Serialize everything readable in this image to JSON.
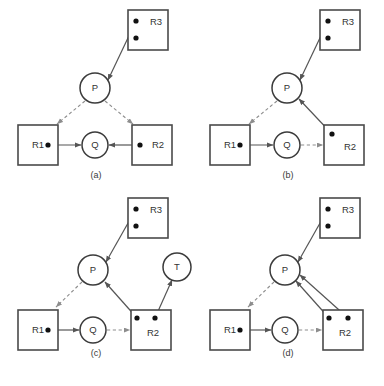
{
  "figure": {
    "width": 384,
    "height": 386,
    "background": "#ffffff",
    "colors": {
      "box_stroke": "#4a4a4a",
      "circle_stroke": "#3b3b3b",
      "dot_fill": "#111111",
      "solid_edge": "#555555",
      "dashed_edge": "#8d8d8d",
      "text": "#333333"
    },
    "legend_semantics": {
      "solid_arrow": "assignment edge (resource held by process)",
      "dashed_arrow": "request edge (process waiting for resource)",
      "square_node": "resource",
      "circle_node": "process",
      "dot": "resource instance"
    }
  },
  "panels": [
    {
      "id": "a",
      "caption": "(a)",
      "caption_x": 96,
      "caption_y": 178,
      "boxes": [
        {
          "name": "R1",
          "label": "R1",
          "x": 18,
          "y": 125,
          "w": 40,
          "h": 40,
          "label_x": 32,
          "label_y": 145,
          "dots": [
            {
              "x": 48,
              "y": 145
            }
          ]
        },
        {
          "name": "R2",
          "label": "R2",
          "x": 132,
          "y": 125,
          "w": 40,
          "h": 40,
          "label_x": 152,
          "label_y": 145,
          "dots": [
            {
              "x": 140,
              "y": 145
            }
          ]
        },
        {
          "name": "R3",
          "label": "R3",
          "x": 128,
          "y": 10,
          "w": 40,
          "h": 40,
          "label_x": 150,
          "label_y": 22,
          "dots": [
            {
              "x": 136,
              "y": 21
            },
            {
              "x": 136,
              "y": 38
            }
          ]
        }
      ],
      "circles": [
        {
          "name": "P",
          "label": "P",
          "cx": 95,
          "cy": 88,
          "r": 15
        },
        {
          "name": "Q",
          "label": "Q",
          "cx": 95,
          "cy": 145,
          "r": 13
        }
      ],
      "edges": [
        {
          "name": "R3-to-P",
          "type": "solid",
          "x1": 136,
          "y1": 21,
          "x2": 108,
          "y2": 80
        },
        {
          "name": "P-to-R1",
          "type": "dashed",
          "x1": 85,
          "y1": 101,
          "x2": 57,
          "y2": 124
        },
        {
          "name": "P-to-R2",
          "type": "dashed",
          "x1": 105,
          "y1": 101,
          "x2": 133,
          "y2": 124
        },
        {
          "name": "R1-to-Q",
          "type": "solid",
          "x1": 48,
          "y1": 145,
          "x2": 81,
          "y2": 145
        },
        {
          "name": "R2-to-Q",
          "type": "solid",
          "x1": 140,
          "y1": 145,
          "x2": 109,
          "y2": 145
        }
      ]
    },
    {
      "id": "b",
      "caption": "(b)",
      "caption_x": 288,
      "caption_y": 178,
      "boxes": [
        {
          "name": "R1",
          "label": "R1",
          "x": 210,
          "y": 125,
          "w": 40,
          "h": 40,
          "label_x": 224,
          "label_y": 145,
          "dots": [
            {
              "x": 240,
              "y": 145
            }
          ]
        },
        {
          "name": "R2",
          "label": "R2",
          "x": 324,
          "y": 125,
          "w": 40,
          "h": 40,
          "label_x": 344,
          "label_y": 147,
          "dots": [
            {
              "x": 332,
              "y": 134
            }
          ]
        },
        {
          "name": "R3",
          "label": "R3",
          "x": 320,
          "y": 10,
          "w": 40,
          "h": 40,
          "label_x": 342,
          "label_y": 22,
          "dots": [
            {
              "x": 328,
              "y": 21
            },
            {
              "x": 328,
              "y": 38
            }
          ]
        }
      ],
      "circles": [
        {
          "name": "P",
          "label": "P",
          "cx": 287,
          "cy": 88,
          "r": 15
        },
        {
          "name": "Q",
          "label": "Q",
          "cx": 287,
          "cy": 145,
          "r": 13
        }
      ],
      "edges": [
        {
          "name": "R3-to-P",
          "type": "solid",
          "x1": 328,
          "y1": 21,
          "x2": 300,
          "y2": 80
        },
        {
          "name": "P-to-R1",
          "type": "dashed",
          "x1": 277,
          "y1": 101,
          "x2": 249,
          "y2": 124
        },
        {
          "name": "R2-to-P",
          "type": "solid",
          "x1": 332,
          "y1": 134,
          "x2": 299,
          "y2": 99
        },
        {
          "name": "R1-to-Q",
          "type": "solid",
          "x1": 240,
          "y1": 145,
          "x2": 273,
          "y2": 145
        },
        {
          "name": "Q-to-R2",
          "type": "dashed",
          "x1": 301,
          "y1": 145,
          "x2": 323,
          "y2": 145
        }
      ]
    },
    {
      "id": "c",
      "caption": "(c)",
      "caption_x": 96,
      "caption_y": 356,
      "boxes": [
        {
          "name": "R1",
          "label": "R1",
          "x": 18,
          "y": 310,
          "w": 40,
          "h": 40,
          "label_x": 32,
          "label_y": 330,
          "dots": [
            {
              "x": 48,
              "y": 330
            }
          ]
        },
        {
          "name": "R2",
          "label": "R2",
          "x": 131,
          "y": 310,
          "w": 40,
          "h": 40,
          "label_x": 147,
          "label_y": 333,
          "dots": [
            {
              "x": 137,
              "y": 318
            },
            {
              "x": 155,
              "y": 318
            }
          ]
        },
        {
          "name": "R3",
          "label": "R3",
          "x": 128,
          "y": 198,
          "w": 40,
          "h": 40,
          "label_x": 150,
          "label_y": 210,
          "dots": [
            {
              "x": 136,
              "y": 209
            },
            {
              "x": 136,
              "y": 226
            }
          ]
        }
      ],
      "circles": [
        {
          "name": "P",
          "label": "P",
          "cx": 93,
          "cy": 270,
          "r": 15
        },
        {
          "name": "Q",
          "label": "Q",
          "cx": 93,
          "cy": 330,
          "r": 13
        },
        {
          "name": "T",
          "label": "T",
          "cx": 177,
          "cy": 267,
          "r": 14
        }
      ],
      "edges": [
        {
          "name": "R3-to-P",
          "type": "solid",
          "x1": 136,
          "y1": 209,
          "x2": 106,
          "y2": 262
        },
        {
          "name": "P-to-R1",
          "type": "dashed",
          "x1": 82,
          "y1": 282,
          "x2": 56,
          "y2": 307
        },
        {
          "name": "R2-to-P",
          "type": "solid",
          "x1": 137,
          "y1": 318,
          "x2": 105,
          "y2": 282
        },
        {
          "name": "R2-to-T",
          "type": "solid",
          "x1": 155,
          "y1": 318,
          "x2": 172,
          "y2": 280
        },
        {
          "name": "R1-to-Q",
          "type": "solid",
          "x1": 48,
          "y1": 330,
          "x2": 79,
          "y2": 330
        },
        {
          "name": "Q-to-R2",
          "type": "dashed",
          "x1": 107,
          "y1": 330,
          "x2": 130,
          "y2": 330
        }
      ]
    },
    {
      "id": "d",
      "caption": "(d)",
      "caption_x": 288,
      "caption_y": 356,
      "boxes": [
        {
          "name": "R1",
          "label": "R1",
          "x": 210,
          "y": 310,
          "w": 40,
          "h": 40,
          "label_x": 224,
          "label_y": 330,
          "dots": [
            {
              "x": 240,
              "y": 330
            }
          ]
        },
        {
          "name": "R2",
          "label": "R2",
          "x": 323,
          "y": 310,
          "w": 40,
          "h": 40,
          "label_x": 339,
          "label_y": 333,
          "dots": [
            {
              "x": 329,
              "y": 318
            },
            {
              "x": 348,
              "y": 318
            }
          ]
        },
        {
          "name": "R3",
          "label": "R3",
          "x": 320,
          "y": 198,
          "w": 40,
          "h": 40,
          "label_x": 342,
          "label_y": 210,
          "dots": [
            {
              "x": 328,
              "y": 209
            },
            {
              "x": 328,
              "y": 226
            }
          ]
        }
      ],
      "circles": [
        {
          "name": "P",
          "label": "P",
          "cx": 285,
          "cy": 270,
          "r": 15
        },
        {
          "name": "Q",
          "label": "Q",
          "cx": 285,
          "cy": 330,
          "r": 13
        }
      ],
      "edges": [
        {
          "name": "R3-to-P",
          "type": "solid",
          "x1": 328,
          "y1": 209,
          "x2": 298,
          "y2": 262
        },
        {
          "name": "P-to-R1",
          "type": "dashed",
          "x1": 274,
          "y1": 282,
          "x2": 248,
          "y2": 307
        },
        {
          "name": "R2-dot1-to-P",
          "type": "solid",
          "x1": 329,
          "y1": 318,
          "x2": 296,
          "y2": 281
        },
        {
          "name": "R2-dot2-to-P",
          "type": "solid",
          "x1": 348,
          "y1": 318,
          "x2": 300,
          "y2": 275
        },
        {
          "name": "R1-to-Q",
          "type": "solid",
          "x1": 240,
          "y1": 330,
          "x2": 271,
          "y2": 330
        },
        {
          "name": "Q-to-R2",
          "type": "dashed",
          "x1": 299,
          "y1": 330,
          "x2": 322,
          "y2": 330
        }
      ]
    }
  ]
}
